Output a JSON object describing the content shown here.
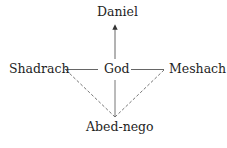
{
  "diagram": {
    "nodes": {
      "top": "Daniel",
      "center": "God",
      "left": "Shadrach",
      "right": "Meshach",
      "bottom": "Abed-nego"
    },
    "edges": [
      {
        "from": "God",
        "to": "Daniel",
        "style": "solid",
        "arrow": true
      },
      {
        "from": "Shadrach",
        "to": "God",
        "style": "solid",
        "arrow": false
      },
      {
        "from": "God",
        "to": "Meshach",
        "style": "solid",
        "arrow": false
      },
      {
        "from": "God",
        "to": "Abed-nego",
        "style": "solid",
        "arrow": false
      },
      {
        "from": "Shadrach",
        "to": "Abed-nego",
        "style": "dashed",
        "arrow": false
      },
      {
        "from": "Meshach",
        "to": "Abed-nego",
        "style": "dashed",
        "arrow": false
      }
    ],
    "line_color": "#555555",
    "text_color": "#1e1e1e"
  }
}
